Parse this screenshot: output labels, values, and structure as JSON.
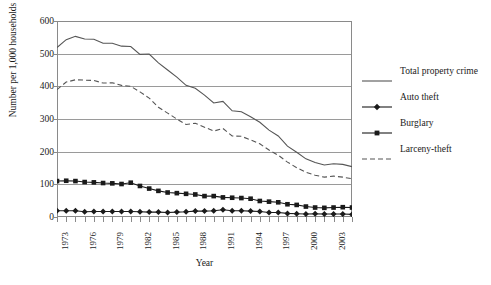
{
  "chart_data": {
    "type": "line",
    "title": "",
    "xlabel": "Year",
    "ylabel": "Number per 1,000 households",
    "xlim": [
      1973,
      2005
    ],
    "ylim": [
      0,
      600
    ],
    "grid": true,
    "legend_position": "right",
    "y_ticks": [
      0,
      100,
      200,
      300,
      400,
      500,
      600
    ],
    "y_tick_labels": [
      "0",
      "100",
      "200",
      "300",
      "400",
      "500",
      "600"
    ],
    "x_tick_labels": [
      "1973",
      "1976",
      "1979",
      "1982",
      "1985",
      "1988",
      "1991",
      "1994",
      "1997",
      "2000",
      "2003"
    ],
    "x_tick_years": [
      1973,
      1976,
      1979,
      1982,
      1985,
      1988,
      1991,
      1994,
      1997,
      2000,
      2003
    ],
    "x": [
      1973,
      1974,
      1975,
      1976,
      1977,
      1978,
      1979,
      1980,
      1981,
      1982,
      1983,
      1984,
      1985,
      1986,
      1987,
      1988,
      1989,
      1990,
      1991,
      1992,
      1993,
      1994,
      1995,
      1996,
      1997,
      1998,
      1999,
      2000,
      2001,
      2002,
      2003,
      2004,
      2005
    ],
    "series": [
      {
        "name": "Total property crime",
        "style": "solid",
        "marker": "none",
        "color": "#555555",
        "values": [
          519,
          543,
          553,
          545,
          544,
          532,
          532,
          523,
          522,
          498,
          499,
          472,
          450,
          428,
          403,
          394,
          373,
          349,
          354,
          325,
          322,
          307,
          290,
          266,
          248,
          217,
          198,
          178,
          167,
          159,
          163,
          161,
          154
        ]
      },
      {
        "name": "Auto theft",
        "style": "solid",
        "marker": "diamond",
        "color": "#1a1a1a",
        "values": [
          19,
          19,
          19,
          16,
          17,
          17,
          17,
          17,
          17,
          16,
          15,
          15,
          14,
          15,
          16,
          18,
          18,
          19,
          22,
          19,
          19,
          18,
          17,
          14,
          14,
          11,
          10,
          9,
          10,
          9,
          9,
          9,
          8
        ]
      },
      {
        "name": "Burglary",
        "style": "solid",
        "marker": "square",
        "color": "#1a1a1a",
        "values": [
          110,
          111,
          110,
          107,
          106,
          104,
          103,
          101,
          105,
          95,
          87,
          80,
          75,
          73,
          71,
          69,
          64,
          64,
          60,
          59,
          58,
          56,
          49,
          47,
          45,
          39,
          37,
          32,
          29,
          28,
          29,
          30,
          29
        ]
      },
      {
        "name": "Larceny-theft",
        "style": "dashed",
        "marker": "none",
        "color": "#555555",
        "values": [
          390,
          413,
          420,
          419,
          418,
          410,
          411,
          403,
          400,
          383,
          364,
          336,
          318,
          300,
          283,
          287,
          275,
          263,
          271,
          248,
          247,
          236,
          224,
          205,
          189,
          168,
          151,
          137,
          128,
          122,
          125,
          122,
          117
        ]
      }
    ]
  },
  "legend": {
    "entries": [
      {
        "label": "Total property crime"
      },
      {
        "label": "Auto theft"
      },
      {
        "label": "Burglary"
      },
      {
        "label": "Larceny-theft"
      }
    ]
  }
}
